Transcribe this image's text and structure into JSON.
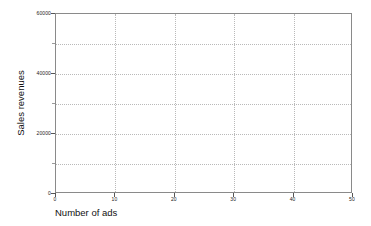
{
  "chart_data": {
    "type": "scatter",
    "title": "",
    "subtitle": "",
    "xlabel": "Number of ads",
    "ylabel": "Sales revenues",
    "xlim": [
      0,
      50
    ],
    "ylim": [
      0,
      60000
    ],
    "grid": true,
    "legend": null,
    "series": [],
    "x": [],
    "values": [],
    "annotations": [],
    "note": "Empty plot: axes and gridlines only, no data points drawn",
    "x_ticks": [
      {
        "value": 0,
        "label": "0"
      },
      {
        "value": 10,
        "label": "10"
      },
      {
        "value": 20,
        "label": "20"
      },
      {
        "value": 30,
        "label": "30"
      },
      {
        "value": 40,
        "label": "40"
      },
      {
        "value": 50,
        "label": "50"
      }
    ],
    "y_ticks": [
      {
        "value": 0,
        "label": "0",
        "major": true
      },
      {
        "value": 10000,
        "label": "",
        "major": false
      },
      {
        "value": 20000,
        "label": "20000",
        "major": true
      },
      {
        "value": 30000,
        "label": "",
        "major": false
      },
      {
        "value": 40000,
        "label": "40000",
        "major": true
      },
      {
        "value": 50000,
        "label": "",
        "major": false
      },
      {
        "value": 60000,
        "label": "60000",
        "major": true
      }
    ],
    "colors": {
      "background": "#ffffff",
      "axis": "#8a8a8a",
      "gridline": "#b9b9b9",
      "text": "#111111"
    }
  }
}
